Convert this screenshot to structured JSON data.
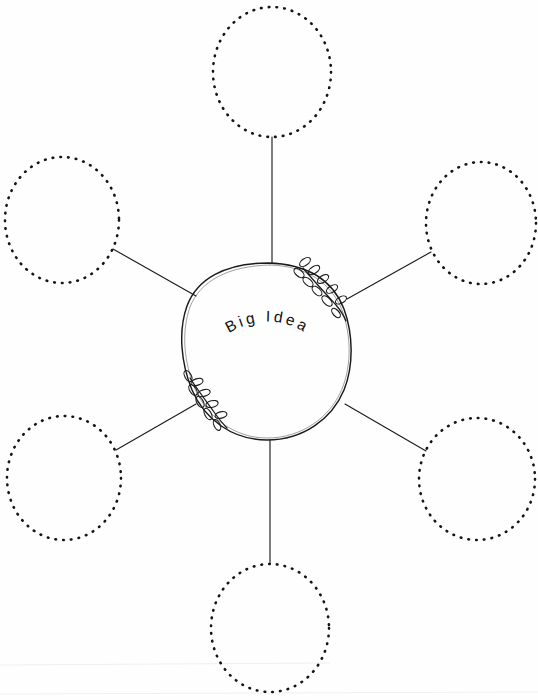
{
  "canvas": {
    "width": 538,
    "height": 700,
    "background_color": "#fefefe",
    "ink_color": "#1a1a1a"
  },
  "worksheet": {
    "title": "Big Idea",
    "type": "radial-brainstorm-web",
    "center_label": "Big Idea",
    "center_label_letters": [
      "B",
      "i",
      "g",
      "I",
      "d",
      "e",
      "a"
    ],
    "branch_count": 6,
    "branch_fill_text": ""
  },
  "center": {
    "name": "big-idea-circle",
    "label": "Big Idea",
    "cx": 266,
    "cy": 351,
    "rx": 84,
    "ry": 89,
    "style": "hand-drawn-circle",
    "decorations": [
      {
        "name": "laurel-branch-top-right",
        "position": "upper-right",
        "leaf_count": 9
      },
      {
        "name": "laurel-branch-bottom-left",
        "position": "lower-left",
        "leaf_count": 8
      }
    ]
  },
  "branches": [
    {
      "id": "branch-top",
      "name": "idea-bubble-top",
      "position": "top",
      "text": "",
      "cx": 272,
      "cy": 72,
      "rx": 59,
      "ry": 65,
      "spoke": {
        "x1": 272,
        "y1": 137,
        "x2": 272,
        "y2": 263
      }
    },
    {
      "id": "branch-upper-left",
      "name": "idea-bubble-upper-left",
      "position": "upper-left",
      "text": "",
      "cx": 62,
      "cy": 220,
      "rx": 57,
      "ry": 63,
      "spoke": {
        "x1": 113,
        "y1": 249,
        "x2": 196,
        "y2": 296
      }
    },
    {
      "id": "branch-upper-right",
      "name": "idea-bubble-upper-right",
      "position": "upper-right",
      "text": "",
      "cx": 481,
      "cy": 223,
      "rx": 55,
      "ry": 61,
      "spoke": {
        "x1": 431,
        "y1": 252,
        "x2": 347,
        "y2": 299
      }
    },
    {
      "id": "branch-lower-left",
      "name": "idea-bubble-lower-left",
      "position": "lower-left",
      "text": "",
      "cx": 64,
      "cy": 478,
      "rx": 57,
      "ry": 62,
      "spoke": {
        "x1": 116,
        "y1": 450,
        "x2": 196,
        "y2": 404
      }
    },
    {
      "id": "branch-lower-right",
      "name": "idea-bubble-lower-right",
      "position": "lower-right",
      "text": "",
      "cx": 477,
      "cy": 479,
      "rx": 58,
      "ry": 61,
      "spoke": {
        "x1": 426,
        "y1": 451,
        "x2": 345,
        "y2": 404
      }
    },
    {
      "id": "branch-bottom",
      "name": "idea-bubble-bottom",
      "position": "bottom",
      "text": "",
      "cx": 270,
      "cy": 628,
      "rx": 59,
      "ry": 64,
      "spoke": {
        "x1": 270,
        "y1": 564,
        "x2": 270,
        "y2": 440
      }
    }
  ]
}
